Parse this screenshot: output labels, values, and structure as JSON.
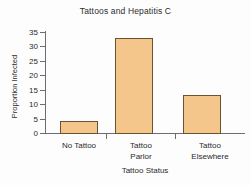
{
  "chart_data": {
    "type": "bar",
    "title": "Tattoos and Hepatitis C",
    "xlabel": "Tattoo Status",
    "ylabel": "Proportion Infected",
    "categories": [
      "No Tattoo",
      "Tattoo Parlor",
      "Tattoo Elsewhere"
    ],
    "values": [
      4,
      33,
      13
    ],
    "ylim": [
      0,
      35
    ],
    "yticks": [
      0,
      5,
      10,
      15,
      20,
      25,
      30,
      35
    ],
    "ytick_labels": [
      "0",
      "5",
      "10",
      "15",
      "20",
      "25",
      "30",
      "35"
    ],
    "grid": false,
    "legend": false,
    "bar_fill_color": "#F5C68C",
    "bar_border_color": "#6B5230",
    "axis_color": "#6D6D6D",
    "background_color": "#FDFDFD",
    "category_lines": [
      [
        "No Tattoo"
      ],
      [
        "Tattoo",
        "Parlor"
      ],
      [
        "Tattoo",
        "Elsewhere"
      ]
    ]
  }
}
